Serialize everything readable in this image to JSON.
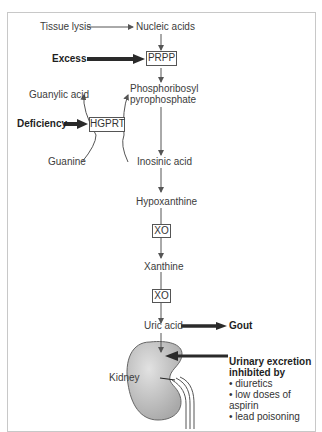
{
  "nodes": {
    "tissue_lysis": "Tissue lysis",
    "nucleic_acids": "Nucleic acids",
    "excess": "Excess",
    "prpp": "PRPP",
    "phosphoribosyl_line1": "Phosphoribosyl",
    "phosphoribosyl_line2": "pyrophosphate",
    "guanylic_acid": "Guanylic acid",
    "deficiency": "Deficiency",
    "hgprt": "HGPRT",
    "guanine": "Guanine",
    "inosinic_acid": "Inosinic acid",
    "hypoxanthine": "Hypoxanthine",
    "xo_1": "XO",
    "xanthine": "Xanthine",
    "xo_2": "XO",
    "uric_acid": "Uric acid",
    "gout": "Gout",
    "kidney": "Kidney"
  },
  "note": {
    "heading_line1": "Urinary excretion",
    "heading_line2": "inhibited by",
    "items": [
      "diuretics",
      "low doses of aspirin",
      "lead poisoning"
    ]
  },
  "colors": {
    "line": "#555555",
    "bold_arrow": "#2a2a2a",
    "kidney_fill": "#c9c9c9",
    "frame": "#c8c8c8"
  }
}
